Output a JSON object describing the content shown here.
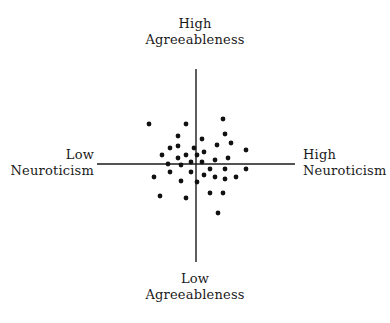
{
  "diagram": {
    "type": "quadrant-scatter",
    "axes": {
      "vertical": {
        "top_label": [
          "High",
          "Agreeableness"
        ],
        "bottom_label": [
          "Low",
          "Agreeableness"
        ]
      },
      "horizontal": {
        "left_label": [
          "Low",
          "Neuroticism"
        ],
        "right_label": [
          "High",
          "Neuroticism"
        ]
      }
    },
    "colors": {
      "axis": "#1a1a1a",
      "point": "#111111",
      "text": "#1a1a1a",
      "background": "#ffffff"
    },
    "geometry": {
      "center": [
        196,
        164
      ],
      "v_axis": [
        69,
        262
      ],
      "h_axis": [
        97,
        295
      ],
      "point_radius": 2.4
    },
    "points": [
      [
        149,
        124
      ],
      [
        186,
        124
      ],
      [
        178,
        136
      ],
      [
        178,
        146
      ],
      [
        170,
        148
      ],
      [
        194,
        148
      ],
      [
        162,
        155
      ],
      [
        186,
        155
      ],
      [
        178,
        158
      ],
      [
        168,
        164
      ],
      [
        181,
        165
      ],
      [
        191,
        162
      ],
      [
        223,
        119
      ],
      [
        225,
        134
      ],
      [
        202,
        139
      ],
      [
        231,
        143
      ],
      [
        217,
        145
      ],
      [
        204,
        152
      ],
      [
        197,
        155
      ],
      [
        246,
        150
      ],
      [
        228,
        158
      ],
      [
        215,
        160
      ],
      [
        202,
        162
      ],
      [
        170,
        172
      ],
      [
        191,
        172
      ],
      [
        154,
        177
      ],
      [
        181,
        181
      ],
      [
        197,
        182
      ],
      [
        160,
        196
      ],
      [
        186,
        198
      ],
      [
        210,
        169
      ],
      [
        225,
        169
      ],
      [
        246,
        169
      ],
      [
        204,
        175
      ],
      [
        215,
        177
      ],
      [
        225,
        179
      ],
      [
        236,
        177
      ],
      [
        210,
        193
      ],
      [
        223,
        193
      ],
      [
        218,
        213
      ]
    ]
  }
}
